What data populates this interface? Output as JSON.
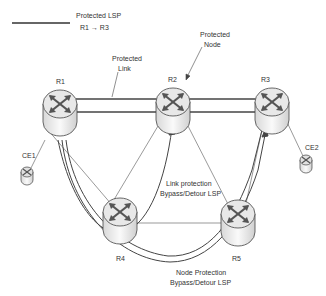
{
  "legend": {
    "line_label": "Protected LSP",
    "path_label": "R1 → R3"
  },
  "annotations": {
    "protected_link_line1": "Protected",
    "protected_link_line2": "Link",
    "protected_node_line1": "Protected",
    "protected_node_line2": "Node",
    "link_protection_line1": "Link protection",
    "link_protection_line2": "Bypass/Detour LSP",
    "node_protection_line1": "Node Protection",
    "node_protection_line2": "Bypass/Detour LSP"
  },
  "routers": {
    "r1": "R1",
    "r2": "R2",
    "r3": "R3",
    "r4": "R4",
    "r5": "R5"
  },
  "customer_edges": {
    "ce1": "CE1",
    "ce2": "CE2"
  },
  "colors": {
    "line": "#444444",
    "router_top": "#e6e6e6",
    "router_body": "#f2f2f2",
    "arrow": "#555555"
  }
}
